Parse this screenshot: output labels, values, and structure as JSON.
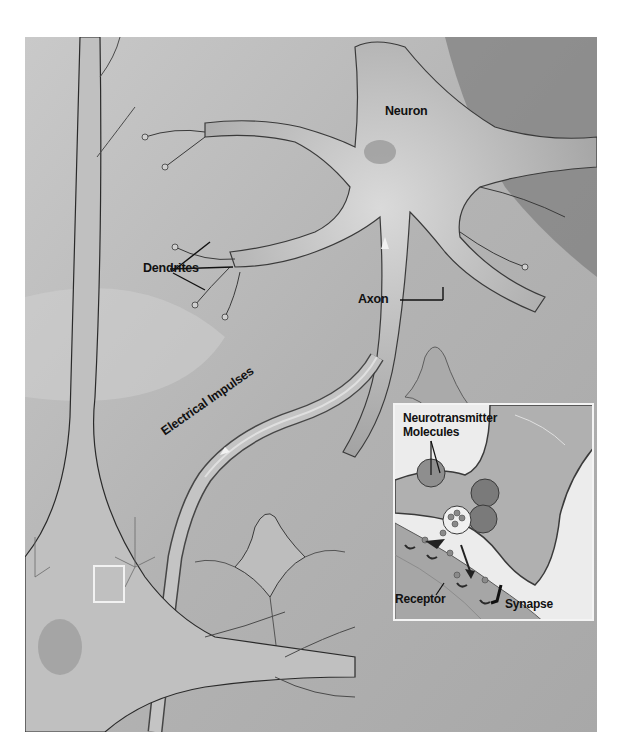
{
  "figure": {
    "style": "grayscale medical illustration",
    "colors": {
      "background": "#b9b9b9",
      "cell_body": "#c8c8c8",
      "outline": "#2a2a2a",
      "inset_background": "#ececec",
      "label_text": "#111111",
      "page_background": "#ffffff"
    }
  },
  "labels": {
    "neuron": "Neuron",
    "dendrites": "Dendrites",
    "axon": "Axon",
    "electrical_impulses": "Electrical Impulses"
  },
  "inset": {
    "labels": {
      "neurotransmitter_line1": "Neurotransmitter",
      "neurotransmitter_line2": "Molecules",
      "receptor": "Receptor",
      "synapse": "Synapse"
    }
  }
}
